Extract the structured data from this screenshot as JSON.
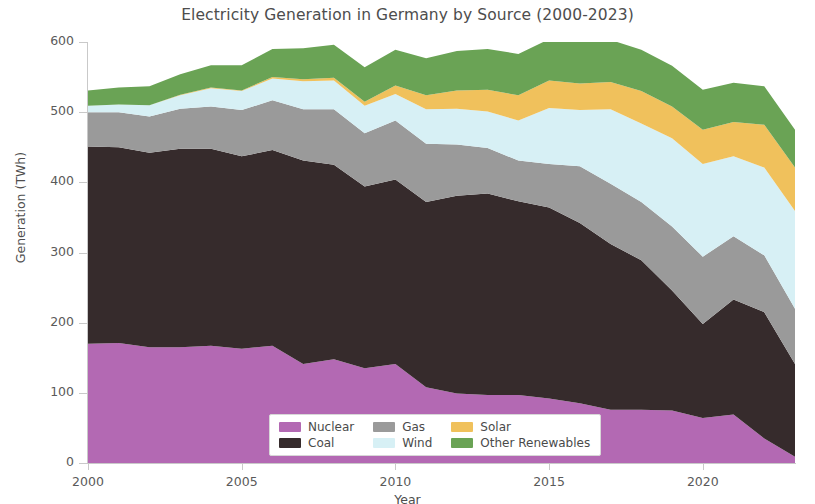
{
  "chart_data": {
    "type": "area",
    "stacked": true,
    "title": "Electricity Generation in Germany by Source (2000-2023)",
    "xlabel": "Year",
    "ylabel": "Generation (TWh)",
    "xlim": [
      2000,
      2023
    ],
    "ylim": [
      0,
      600
    ],
    "xticks": [
      2000,
      2005,
      2010,
      2015,
      2020
    ],
    "yticks": [
      0,
      100,
      200,
      300,
      400,
      500,
      600
    ],
    "grid": false,
    "legend_position": "lower center",
    "x": [
      2000,
      2001,
      2002,
      2003,
      2004,
      2005,
      2006,
      2007,
      2008,
      2009,
      2010,
      2011,
      2012,
      2013,
      2014,
      2015,
      2016,
      2017,
      2018,
      2019,
      2020,
      2021,
      2022,
      2023
    ],
    "series": [
      {
        "name": "Nuclear",
        "color": "#b369b3",
        "values": [
          170,
          171,
          165,
          165,
          167,
          163,
          167,
          141,
          148,
          135,
          141,
          108,
          99,
          97,
          97,
          92,
          85,
          76,
          76,
          75,
          64,
          69,
          35,
          9
        ]
      },
      {
        "name": "Coal",
        "color": "#362b2c",
        "values": [
          281,
          279,
          277,
          283,
          281,
          274,
          279,
          290,
          277,
          259,
          263,
          264,
          282,
          287,
          276,
          272,
          257,
          236,
          213,
          171,
          134,
          164,
          180,
          132
        ]
      },
      {
        "name": "Gas",
        "color": "#9a9a9a",
        "values": [
          49,
          50,
          52,
          57,
          60,
          66,
          71,
          73,
          79,
          76,
          84,
          83,
          73,
          65,
          58,
          62,
          81,
          86,
          83,
          91,
          96,
          90,
          81,
          79
        ]
      },
      {
        "name": "Wind",
        "color": "#d7f0f5",
        "values": [
          9,
          11,
          16,
          19,
          26,
          27,
          31,
          40,
          41,
          39,
          38,
          49,
          51,
          52,
          57,
          80,
          80,
          106,
          112,
          126,
          132,
          114,
          125,
          139
        ]
      },
      {
        "name": "Solar",
        "color": "#f0c15c",
        "values": [
          0,
          0,
          0,
          1,
          1,
          1,
          2,
          3,
          4,
          6,
          12,
          20,
          26,
          31,
          36,
          39,
          38,
          39,
          46,
          45,
          49,
          49,
          61,
          62
        ]
      },
      {
        "name": "Other Renewables",
        "color": "#6aa355",
        "values": [
          22,
          24,
          27,
          29,
          32,
          36,
          40,
          44,
          47,
          49,
          51,
          53,
          56,
          58,
          59,
          59,
          60,
          60,
          59,
          58,
          57,
          56,
          55,
          54
        ]
      }
    ]
  },
  "legend": {
    "entries": [
      {
        "label": "Nuclear",
        "color": "#b369b3"
      },
      {
        "label": "Gas",
        "color": "#9a9a9a"
      },
      {
        "label": "Solar",
        "color": "#f0c15c"
      },
      {
        "label": "Coal",
        "color": "#362b2c"
      },
      {
        "label": "Wind",
        "color": "#d7f0f5"
      },
      {
        "label": "Other Renewables",
        "color": "#6aa355"
      }
    ]
  }
}
